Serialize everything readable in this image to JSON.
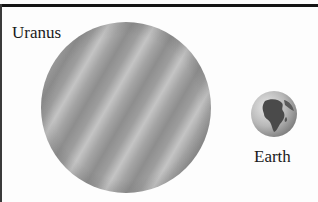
{
  "figure": {
    "planets": [
      {
        "name": "Uranus",
        "label": "Uranus",
        "relative_size": "large",
        "color": "#a3a3a3"
      },
      {
        "name": "Earth",
        "label": "Earth",
        "relative_size": "small",
        "color": "#8a8a8a"
      }
    ]
  },
  "icons": {
    "uranus": "uranus-planet-icon",
    "earth": "earth-globe-icon"
  }
}
